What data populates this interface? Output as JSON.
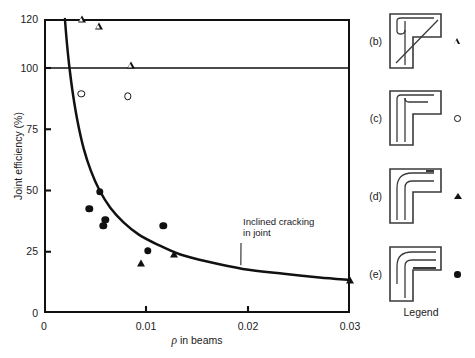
{
  "chart_data": {
    "type": "scatter",
    "title": "",
    "xlabel": "ρ in beams",
    "ylabel": "Joint efficiency (%)",
    "xlim": [
      0,
      0.03
    ],
    "ylim": [
      0,
      120
    ],
    "grid": false,
    "legend_position": "right-panel",
    "x_ticks": [
      {
        "value": 0,
        "label": "0"
      },
      {
        "value": 0.01,
        "label": "0.01"
      },
      {
        "value": 0.02,
        "label": "0.02"
      },
      {
        "value": 0.03,
        "label": "0.03"
      }
    ],
    "y_ticks": [
      {
        "value": 0,
        "label": "0"
      },
      {
        "value": 25,
        "label": "25"
      },
      {
        "value": 50,
        "label": "50"
      },
      {
        "value": 75,
        "label": "75"
      },
      {
        "value": 100,
        "label": "100"
      },
      {
        "value": 120,
        "label": "120"
      }
    ],
    "reference_lines": [
      {
        "name": "full-efficiency-line",
        "orientation": "horizontal",
        "y": 100
      }
    ],
    "annotations": [
      {
        "name": "inclined-cracking-annotation",
        "line1": "Inclined cracking",
        "line2": "in joint",
        "points_to": {
          "x": 0.0193,
          "y": 19.5
        }
      }
    ],
    "curve": {
      "name": "inclined-cracking-curve",
      "label": "Inclined cracking in joint",
      "points": [
        {
          "x": 0.00205,
          "y": 120
        },
        {
          "x": 0.00225,
          "y": 110
        },
        {
          "x": 0.0025,
          "y": 100
        },
        {
          "x": 0.00285,
          "y": 89
        },
        {
          "x": 0.0033,
          "y": 78
        },
        {
          "x": 0.0039,
          "y": 67
        },
        {
          "x": 0.0046,
          "y": 58
        },
        {
          "x": 0.00545,
          "y": 50
        },
        {
          "x": 0.0065,
          "y": 43
        },
        {
          "x": 0.0078,
          "y": 37
        },
        {
          "x": 0.0093,
          "y": 32
        },
        {
          "x": 0.0111,
          "y": 28
        },
        {
          "x": 0.0133,
          "y": 24
        },
        {
          "x": 0.016,
          "y": 21
        },
        {
          "x": 0.0195,
          "y": 18
        },
        {
          "x": 0.0235,
          "y": 16
        },
        {
          "x": 0.027,
          "y": 14.5
        },
        {
          "x": 0.03,
          "y": 13.5
        }
      ]
    },
    "series": [
      {
        "name": "(b)",
        "marker": "open-triangle",
        "points": [
          {
            "x": 0.0037,
            "y": 120
          },
          {
            "x": 0.0054,
            "y": 120
          },
          {
            "x": 0.00855,
            "y": 107
          }
        ]
      },
      {
        "name": "(c)",
        "marker": "open-circle",
        "points": [
          {
            "x": 0.00365,
            "y": 89.5
          },
          {
            "x": 0.0082,
            "y": 88.5
          }
        ]
      },
      {
        "name": "(d)",
        "marker": "filled-triangle",
        "points": [
          {
            "x": 0.00955,
            "y": 20.5
          },
          {
            "x": 0.01275,
            "y": 24
          },
          {
            "x": 0.03,
            "y": 13.5
          }
        ]
      },
      {
        "name": "(e)",
        "marker": "filled-circle",
        "points": [
          {
            "x": 0.00545,
            "y": 49.5
          },
          {
            "x": 0.00445,
            "y": 42.5
          },
          {
            "x": 0.006,
            "y": 38
          },
          {
            "x": 0.0058,
            "y": 35.5
          },
          {
            "x": 0.0117,
            "y": 35.5
          },
          {
            "x": 0.01015,
            "y": 25.5
          }
        ]
      }
    ]
  },
  "legend": {
    "caption": "Legend",
    "items": [
      {
        "tag": "(b)",
        "marker": "open-triangle",
        "diagram_name": "knee-joint-detail-b",
        "diagram_description": "L-shaped knee joint with diagonal bar"
      },
      {
        "tag": "(c)",
        "marker": "open-circle",
        "diagram_name": "knee-joint-detail-c",
        "diagram_description": "L-shaped knee joint with small hooked bar"
      },
      {
        "tag": "(d)",
        "marker": "filled-triangle",
        "diagram_name": "knee-joint-detail-d",
        "diagram_description": "L-shaped knee joint with large radius bent bar"
      },
      {
        "tag": "(e)",
        "marker": "filled-circle",
        "diagram_name": "knee-joint-detail-e",
        "diagram_description": "L-shaped knee joint with looped continuous bar"
      }
    ]
  },
  "colors": {
    "ink": "#111111",
    "background": "#ffffff"
  }
}
